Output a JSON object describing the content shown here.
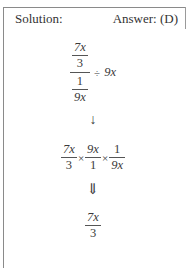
{
  "header": {
    "solution_label": "Solution:",
    "answer_label": "Answer: (D)"
  },
  "step1": {
    "outer_numerator": {
      "top": "7x",
      "bottom": "3"
    },
    "outer_denominator": {
      "top": "1",
      "bottom": "9x"
    },
    "operator": "÷",
    "divisor": "9x"
  },
  "arrow1": "↓",
  "step2": {
    "f1": {
      "num": "7x",
      "den": "3"
    },
    "op1": "×",
    "f2": {
      "num": "9x",
      "den": "1"
    },
    "op2": "×",
    "f3": {
      "num": "1",
      "den": "9x"
    }
  },
  "arrow2": "⇓",
  "result": {
    "num": "7x",
    "den": "3"
  }
}
